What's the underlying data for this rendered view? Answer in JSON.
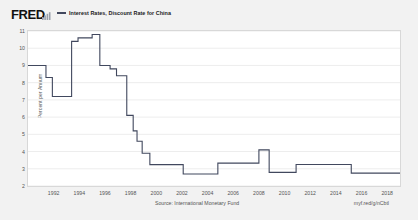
{
  "header": {
    "logo_text": "FRED",
    "logo_glyph_icon": "bar-chart-icon",
    "legend_label": "Interest Rates, Discount Rate for China",
    "legend_color": "#41485e"
  },
  "footer": {
    "source": "Source: International Monetary Fund",
    "permalink": "myf.red/g/nCbtl"
  },
  "chart_data": {
    "type": "line",
    "title": "Interest Rates, Discount Rate for China",
    "xlabel": "",
    "ylabel": "Percent per Annum",
    "xlim": [
      1990.0,
      2019.0
    ],
    "ylim": [
      2,
      11
    ],
    "yticks": [
      2,
      3,
      4,
      5,
      6,
      7,
      8,
      9,
      10,
      11
    ],
    "xticks": [
      1992,
      1994,
      1996,
      1998,
      2000,
      2002,
      2004,
      2006,
      2008,
      2010,
      2012,
      2014,
      2016,
      2018
    ],
    "grid": true,
    "legend_position": "top",
    "line_color": "#41485e",
    "step": "post",
    "series": [
      {
        "name": "Interest Rates, Discount Rate for China",
        "x": [
          1990.0,
          1991.4,
          1991.9,
          1993.4,
          1993.9,
          1995.0,
          1995.6,
          1996.4,
          1996.9,
          1997.7,
          1998.2,
          1998.5,
          1998.9,
          1999.5,
          2002.1,
          2004.8,
          2006.3,
          2007.2,
          2008.0,
          2008.8,
          2010.9,
          2011.5,
          2015.2,
          2019.0
        ],
        "values": [
          9.0,
          8.3,
          7.2,
          10.4,
          10.6,
          10.8,
          9.0,
          8.8,
          8.4,
          6.1,
          5.2,
          4.6,
          3.9,
          3.24,
          2.7,
          3.33,
          3.33,
          3.33,
          4.1,
          2.79,
          3.25,
          3.25,
          2.75,
          2.75
        ]
      }
    ]
  }
}
